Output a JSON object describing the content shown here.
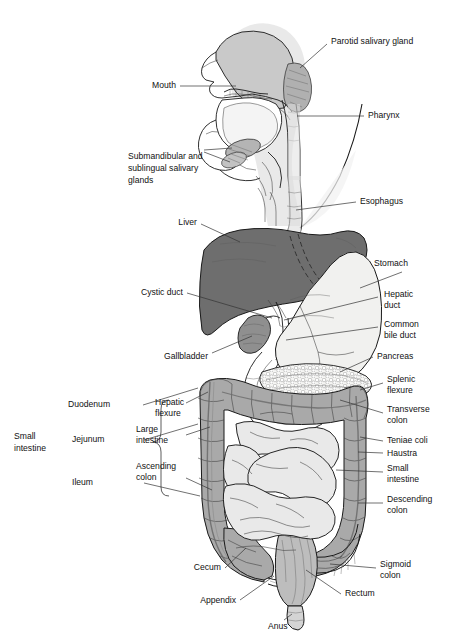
{
  "figure": {
    "type": "anatomical-illustration",
    "background_color": "#ffffff",
    "palette": {
      "liver": "#6e6e6e",
      "stomach": "#f0f0ee",
      "large_intestine": "#a9a9a9",
      "small_intestine": "#e9e9e9",
      "gallbladder": "#8f8f8f",
      "salivary_gland": "#9a9a9a",
      "head_silhouette": "#dcdcdc",
      "pancreas": "#f4f4f2",
      "outline": "#1a1a1a",
      "leader_line": "#333333",
      "text": "#111111"
    }
  },
  "labels": {
    "parotid_salivary_gland": "Parotid salivary gland",
    "mouth": "Mouth",
    "pharynx": "Pharynx",
    "submandibular_sublingual": "Submandibular and\nsublingual salivary\nglands",
    "submandibular_line1": "Submandibular and",
    "submandibular_line2": "sublingual salivary",
    "submandibular_line3": "glands",
    "esophagus": "Esophagus",
    "liver": "Liver",
    "stomach": "Stomach",
    "cystic_duct": "Cystic duct",
    "hepatic_duct_line1": "Hepatic",
    "hepatic_duct_line2": "duct",
    "common_bile_duct_line1": "Common",
    "common_bile_duct_line2": "bile duct",
    "gallbladder": "Gallbladder",
    "pancreas": "Pancreas",
    "splenic_flexure_line1": "Splenic",
    "splenic_flexure_line2": "flexure",
    "duodenum": "Duodenum",
    "hepatic_flexure_line1": "Hepatic",
    "hepatic_flexure_line2": "flexure",
    "transverse_colon_line1": "Transverse",
    "transverse_colon_line2": "colon",
    "small_intestine_group_line1": "Small",
    "small_intestine_group_line2": "intestine",
    "jejunum": "Jejunum",
    "large_intestine_line1": "Large",
    "large_intestine_line2": "intestine",
    "teniae_coli": "Teniae coli",
    "haustra": "Haustra",
    "ileum": "Ileum",
    "ascending_colon_line1": "Ascending",
    "ascending_colon_line2": "colon",
    "small_intestine_right_line1": "Small",
    "small_intestine_right_line2": "intestine",
    "descending_colon_line1": "Descending",
    "descending_colon_line2": "colon",
    "cecum": "Cecum",
    "sigmoid_colon_line1": "Sigmoid",
    "sigmoid_colon_line2": "colon",
    "appendix": "Appendix",
    "rectum": "Rectum",
    "anus": "Anus"
  },
  "structures": [
    {
      "name": "parotid-salivary-gland",
      "label": "Parotid salivary gland"
    },
    {
      "name": "mouth",
      "label": "Mouth"
    },
    {
      "name": "pharynx",
      "label": "Pharynx"
    },
    {
      "name": "submandibular-sublingual-salivary-glands",
      "label": "Submandibular and sublingual salivary glands"
    },
    {
      "name": "esophagus",
      "label": "Esophagus"
    },
    {
      "name": "liver",
      "label": "Liver"
    },
    {
      "name": "stomach",
      "label": "Stomach"
    },
    {
      "name": "cystic-duct",
      "label": "Cystic duct"
    },
    {
      "name": "hepatic-duct",
      "label": "Hepatic duct"
    },
    {
      "name": "common-bile-duct",
      "label": "Common bile duct"
    },
    {
      "name": "gallbladder",
      "label": "Gallbladder"
    },
    {
      "name": "pancreas",
      "label": "Pancreas"
    },
    {
      "name": "splenic-flexure",
      "label": "Splenic flexure"
    },
    {
      "name": "hepatic-flexure",
      "label": "Hepatic flexure"
    },
    {
      "name": "transverse-colon",
      "label": "Transverse colon"
    },
    {
      "name": "duodenum",
      "label": "Duodenum"
    },
    {
      "name": "jejunum",
      "label": "Jejunum"
    },
    {
      "name": "ileum",
      "label": "Ileum"
    },
    {
      "name": "small-intestine",
      "label": "Small intestine"
    },
    {
      "name": "large-intestine",
      "label": "Large intestine"
    },
    {
      "name": "teniae-coli",
      "label": "Teniae coli"
    },
    {
      "name": "haustra",
      "label": "Haustra"
    },
    {
      "name": "ascending-colon",
      "label": "Ascending colon"
    },
    {
      "name": "descending-colon",
      "label": "Descending colon"
    },
    {
      "name": "sigmoid-colon",
      "label": "Sigmoid colon"
    },
    {
      "name": "cecum",
      "label": "Cecum"
    },
    {
      "name": "appendix",
      "label": "Appendix"
    },
    {
      "name": "rectum",
      "label": "Rectum"
    },
    {
      "name": "anus",
      "label": "Anus"
    }
  ]
}
